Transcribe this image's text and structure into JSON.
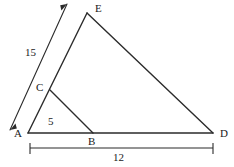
{
  "figure": {
    "type": "geometry-diagram",
    "stroke_color": "#2b2b2b",
    "background_color": "#ffffff",
    "text_color": "#1a1a1a"
  },
  "points": {
    "A": {
      "label": "A",
      "x": 28,
      "y": 133,
      "label_x": 14,
      "label_y": 128
    },
    "B": {
      "label": "B",
      "x": 93,
      "y": 133,
      "label_x": 88,
      "label_y": 136
    },
    "C": {
      "label": "C",
      "x": 50,
      "y": 90,
      "label_x": 36,
      "label_y": 82
    },
    "D": {
      "label": "D",
      "x": 213,
      "y": 133,
      "label_x": 220,
      "label_y": 128
    },
    "E": {
      "label": "E",
      "x": 87,
      "y": 13,
      "label_x": 95,
      "label_y": 3
    }
  },
  "segments": [
    {
      "name": "A-E",
      "from": "A",
      "to": "E"
    },
    {
      "name": "E-D",
      "from": "E",
      "to": "D"
    },
    {
      "name": "A-D",
      "from": "A",
      "to": "D"
    },
    {
      "name": "C-B",
      "from": "C",
      "to": "B"
    }
  ],
  "dimensions": {
    "side_15": {
      "value": "15",
      "measures": "A-E",
      "label_x": 25,
      "label_y": 47,
      "line": {
        "x1": 10,
        "y1": 130,
        "x2": 67,
        "y2": 4
      },
      "style": "double-arrow"
    },
    "side_5": {
      "value": "5",
      "measures": "A-B",
      "label_x": 48,
      "label_y": 116,
      "style": "inline-text"
    },
    "base_12": {
      "value": "12",
      "measures": "A-D",
      "label_x": 113,
      "label_y": 152,
      "line": {
        "x1": 30,
        "y1": 148,
        "x2": 213,
        "y2": 148
      },
      "style": "tick-ends"
    }
  }
}
